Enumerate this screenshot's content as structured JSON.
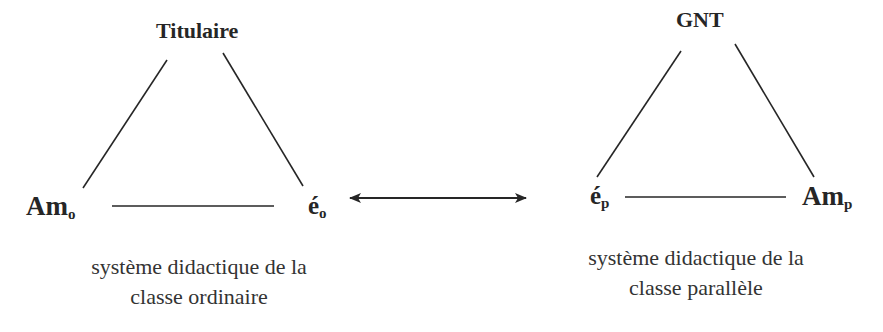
{
  "diagram": {
    "type": "two didactic triangles linked by a bidirectional arrow",
    "left_system": {
      "top_node": "Titulaire",
      "bottom_left_node": {
        "base": "Am",
        "sub": "o"
      },
      "bottom_right_node": {
        "base": "é",
        "sub": "o"
      },
      "caption_line1": "système didactique de la",
      "caption_line2": "classe ordinaire"
    },
    "right_system": {
      "top_node": "GNT",
      "bottom_left_node": {
        "base": "é",
        "sub": "p"
      },
      "bottom_right_node": {
        "base": "Am",
        "sub": "p"
      },
      "caption_line1": "système didactique de la",
      "caption_line2": "classe parallèle"
    },
    "link": {
      "from": "é_o",
      "to": "é_p",
      "direction": "bidirectional"
    },
    "colors": {
      "ink": "#262626",
      "background": "#ffffff"
    }
  }
}
